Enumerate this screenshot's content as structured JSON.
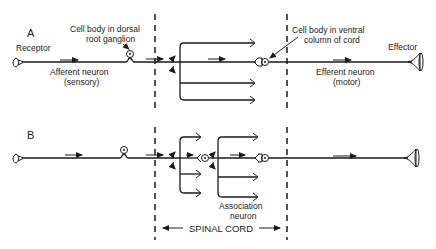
{
  "panels": {
    "a": {
      "letter": "A",
      "receptor": "Receptor",
      "dorsal_cell_body_l1": "Cell body in dorsal",
      "dorsal_cell_body_l2": "root ganglion",
      "afferent_l1": "Afferent neuron",
      "afferent_l2": "(sensory)",
      "ventral_cell_body_l1": "Cell body in ventral",
      "ventral_cell_body_l2": "column of cord",
      "effector": "Effector",
      "efferent_l1": "Efferent neuron",
      "efferent_l2": "(motor)"
    },
    "b": {
      "letter": "B",
      "association_l1": "Association",
      "association_l2": "neuron"
    }
  },
  "spinal_cord": {
    "label": "SPINAL CORD"
  },
  "colors": {
    "ink": "#1a1a1a",
    "background": "#ffffff"
  }
}
